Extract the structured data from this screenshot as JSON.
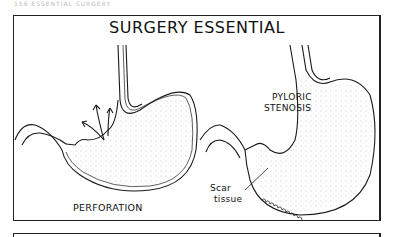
{
  "header": {
    "text": "156   ESSENTIAL SURGERY"
  },
  "figure": {
    "title": "SURGERY ESSENTIAL",
    "left_panel": {
      "label": "PERFORATION"
    },
    "right_panel": {
      "label_line1": "PYLORIC",
      "label_line2": "STENOSIS",
      "callout_line1": "Scar",
      "callout_line2": "tissue"
    }
  },
  "colors": {
    "ink": "#1a1a1a",
    "background": "#ffffff",
    "stipple": "#9a9a9a"
  }
}
